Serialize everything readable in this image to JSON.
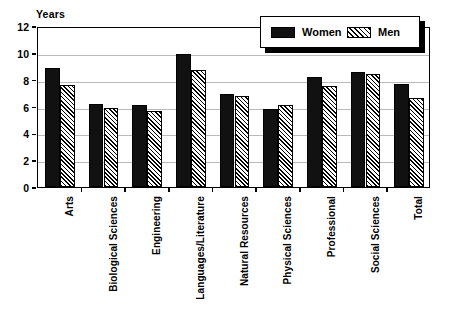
{
  "chart_data": {
    "type": "bar",
    "title": "",
    "xlabel": "",
    "ylabel": "Years",
    "ylim": [
      0,
      12
    ],
    "yticks": [
      0,
      2,
      4,
      6,
      8,
      10,
      12
    ],
    "grid": true,
    "legend_position": "top-right",
    "categories": [
      "Arts",
      "Biological Sciences",
      "Engineering",
      "Languages/Literature",
      "Natural Resources",
      "Physical Sciences",
      "Professional",
      "Social Sciences",
      "Total"
    ],
    "series": [
      {
        "name": "Women",
        "fill": "solid-black",
        "color": "#111111",
        "values": [
          8.9,
          6.2,
          6.1,
          9.9,
          6.9,
          5.8,
          8.2,
          8.6,
          7.7
        ]
      },
      {
        "name": "Men",
        "fill": "diagonal-hatch",
        "color": "#ffffff",
        "values": [
          7.6,
          5.9,
          5.7,
          8.7,
          6.8,
          6.1,
          7.5,
          8.4,
          6.6
        ]
      }
    ]
  },
  "axis": {
    "y_title": "Years"
  },
  "legend": {
    "items": [
      {
        "label": "Women",
        "swatch": "solid-swatch-icon"
      },
      {
        "label": "Men",
        "swatch": "hatched-swatch-icon"
      }
    ]
  }
}
